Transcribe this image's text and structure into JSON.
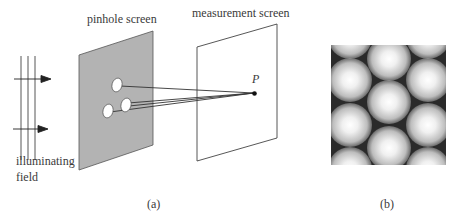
{
  "panel_a": {
    "pinhole_screen_label": "pinhole screen",
    "measurement_screen_label": "measurement screen",
    "point_label": "P",
    "field_label_line1": "illuminating",
    "field_label_line2": "field",
    "caption": "(a)",
    "colors": {
      "pinhole_screen_fill": "#b3b3b3",
      "line": "#333333"
    }
  },
  "panel_b": {
    "caption": "(b)",
    "description": "interference pattern: hexagonal array of bright spots on dark background"
  }
}
